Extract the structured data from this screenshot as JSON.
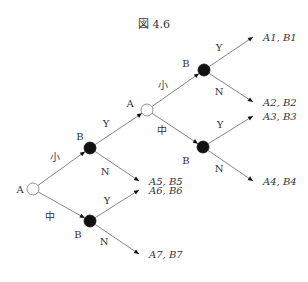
{
  "figure": {
    "title": "図 4.6"
  },
  "tree": {
    "nodes": [
      {
        "id": "root",
        "player": "A",
        "type": "open",
        "x": 33,
        "y": 189,
        "label_dx": -13,
        "label_dy": 4
      },
      {
        "id": "b1",
        "player": "B",
        "type": "filled",
        "x": 90,
        "y": 148,
        "label_dx": -10,
        "label_dy": -8
      },
      {
        "id": "b2",
        "player": "B",
        "type": "filled",
        "x": 90,
        "y": 221,
        "label_dx": -12,
        "label_dy": 17
      },
      {
        "id": "a2",
        "player": "A",
        "type": "open",
        "x": 147,
        "y": 110,
        "label_dx": -17,
        "label_dy": -3
      },
      {
        "id": "b3",
        "player": "B",
        "type": "filled",
        "x": 204,
        "y": 70,
        "label_dx": -18,
        "label_dy": -3
      },
      {
        "id": "b4",
        "player": "B",
        "type": "filled",
        "x": 203,
        "y": 147,
        "label_dx": -17,
        "label_dy": 17
      }
    ],
    "edges": [
      {
        "from": "root",
        "to": "b1",
        "label": "小",
        "lx": 55,
        "ly": 161
      },
      {
        "from": "root",
        "to": "b2",
        "label": "中",
        "lx": 50,
        "ly": 220
      },
      {
        "from": "b1",
        "to": "a2",
        "label": "Y",
        "lx": 106,
        "ly": 127
      },
      {
        "from": "b1",
        "to": "leaf5",
        "label": "N",
        "lx": 105,
        "ly": 175
      },
      {
        "from": "b2",
        "to": "leaf6",
        "label": "Y",
        "lx": 107,
        "ly": 204
      },
      {
        "from": "b2",
        "to": "leaf7",
        "label": "N",
        "lx": 104,
        "ly": 245
      },
      {
        "from": "a2",
        "to": "b3",
        "label": "小",
        "lx": 163,
        "ly": 89
      },
      {
        "from": "a2",
        "to": "b4",
        "label": "中",
        "lx": 162,
        "ly": 134
      },
      {
        "from": "b3",
        "to": "leaf1",
        "label": "Y",
        "lx": 219,
        "ly": 51
      },
      {
        "from": "b3",
        "to": "leaf2",
        "label": "N",
        "lx": 219,
        "ly": 95
      },
      {
        "from": "b4",
        "to": "leaf3",
        "label": "Y",
        "lx": 220,
        "ly": 128
      },
      {
        "from": "b4",
        "to": "leaf4",
        "label": "N",
        "lx": 219,
        "ly": 172
      }
    ],
    "leaves": [
      {
        "id": "leaf1",
        "text": "A1, B1",
        "x": 253,
        "y": 37
      },
      {
        "id": "leaf2",
        "text": "A2, B2",
        "x": 253,
        "y": 102
      },
      {
        "id": "leaf3",
        "text": "A3, B3",
        "x": 253,
        "y": 116
      },
      {
        "id": "leaf4",
        "text": "A4, B4",
        "x": 253,
        "y": 181
      },
      {
        "id": "leaf5",
        "text": "A5, B5",
        "x": 139,
        "y": 181
      },
      {
        "id": "leaf6",
        "text": "A6, B6",
        "x": 139,
        "y": 190
      },
      {
        "id": "leaf7",
        "text": "A7, B7",
        "x": 139,
        "y": 254
      }
    ]
  },
  "colors": {
    "line": "#666666",
    "node_fill": "#111111",
    "text": "#333333"
  }
}
